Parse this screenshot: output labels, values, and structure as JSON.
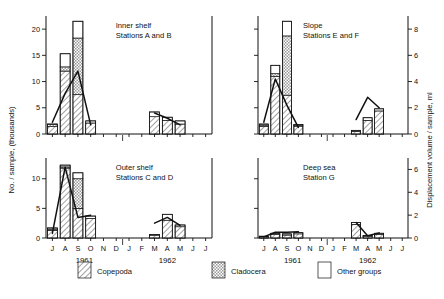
{
  "figure": {
    "left_axis_title": "No. / sample, (thousands)",
    "right_axis_title": "Displacement volume / sample, ml",
    "year_labels": [
      "1961",
      "1962"
    ],
    "months_1961": [
      "J",
      "A",
      "S",
      "O",
      "N",
      "D"
    ],
    "months_1962": [
      "J",
      "F",
      "M",
      "A",
      "M",
      "J",
      "J"
    ]
  },
  "legend": {
    "items": [
      {
        "label": "Copepoda",
        "pattern": "diagonal-hatch"
      },
      {
        "label": "Cladocera",
        "pattern": "stipple"
      },
      {
        "label": "Other groups",
        "pattern": "blank"
      }
    ]
  },
  "chart_data": {
    "type": "bar",
    "title": "",
    "xlabel": "",
    "ylabel": "No. / sample, (thousands)",
    "y2label": "Displacement volume / sample, ml",
    "grid": false,
    "legend_position": "bottom",
    "categories": [
      "J-1961",
      "A-1961",
      "S-1961",
      "O-1961",
      "N-1961",
      "D-1961",
      "J-1962",
      "F-1962",
      "M-1962",
      "A-1962",
      "M-1962b",
      "J-1962",
      "J-1962b"
    ],
    "panels": [
      {
        "name": "inner-shelf",
        "title_line1": "Inner shelf",
        "title_line2": "Stations A and B",
        "ylim": [
          0,
          22.5
        ],
        "yticks": [
          0,
          5,
          10,
          15,
          20
        ],
        "ytick_labels": [
          "0",
          "5",
          "10",
          "15",
          "20"
        ],
        "y2lim": [
          0,
          9
        ],
        "series": [
          {
            "name": "Copepoda",
            "values": [
              1.4,
              12.0,
              7.5,
              2.1,
              0,
              0,
              0,
              0,
              3.3,
              2.6,
              1.9,
              0,
              0
            ]
          },
          {
            "name": "Cladocera",
            "values": [
              0.4,
              0.8,
              10.8,
              0.0,
              0,
              0,
              0,
              0,
              0.0,
              0.0,
              0.0,
              0,
              0
            ]
          },
          {
            "name": "Other groups",
            "values": [
              0.1,
              2.5,
              3.2,
              0.4,
              0,
              0,
              0,
              0,
              0.9,
              0.6,
              0.6,
              0,
              0
            ]
          }
        ],
        "totals": [
          1.9,
          15.3,
          21.5,
          2.5,
          0,
          0,
          0,
          0,
          4.2,
          3.2,
          2.5,
          0,
          0
        ],
        "volume_line": {
          "name": "Displacement volume",
          "x": [
            "J-1961",
            "A-1961",
            "S-1961",
            "O-1961"
          ],
          "values": [
            0.9,
            3.1,
            4.8,
            0.7
          ]
        },
        "volume_line2": {
          "x": [
            "M-1962",
            "A-1962",
            "M-1962b"
          ],
          "values": [
            1.6,
            1.2,
            0.7
          ]
        }
      },
      {
        "name": "slope",
        "title_line1": "Slope",
        "title_line2": "Stations E and F",
        "ylim": [
          0,
          22.5
        ],
        "yticks": [
          0,
          5,
          10,
          15,
          20
        ],
        "ytick_labels": [
          "",
          "",
          "",
          "",
          ""
        ],
        "y2lim": [
          0,
          9
        ],
        "y2ticks": [
          0,
          2,
          4,
          6,
          8
        ],
        "y2tick_labels": [
          "0",
          "2",
          "4",
          "6",
          "8"
        ],
        "series": [
          {
            "name": "Copepoda",
            "values": [
              1.4,
              11.0,
              7.4,
              1.5,
              0,
              0,
              0,
              0,
              0.5,
              2.6,
              4.4,
              0,
              0
            ]
          },
          {
            "name": "Cladocera",
            "values": [
              0.3,
              0.5,
              11.3,
              0.1,
              0,
              0,
              0,
              0,
              0.0,
              0.0,
              0.0,
              0,
              0
            ]
          },
          {
            "name": "Other groups",
            "values": [
              0.2,
              1.6,
              2.8,
              0.2,
              0,
              0,
              0,
              0,
              0.2,
              0.5,
              0.4,
              0,
              0
            ]
          }
        ],
        "totals": [
          1.9,
          13.1,
          21.5,
          1.8,
          0,
          0,
          0,
          0,
          0.7,
          3.1,
          4.8,
          0,
          0
        ],
        "volume_line": {
          "x": [
            "J-1961",
            "A-1961",
            "S-1961",
            "O-1961"
          ],
          "values": [
            0.9,
            4.2,
            2.2,
            0.5
          ]
        },
        "volume_line2": {
          "x": [
            "M-1962",
            "A-1962",
            "M-1962b"
          ],
          "values": [
            1.1,
            2.8,
            2.0
          ]
        }
      },
      {
        "name": "outer-shelf",
        "title_line1": "Outer shelf",
        "title_line2": "Stations C and D",
        "ylim": [
          0,
          13.5
        ],
        "yticks": [
          0,
          5,
          10
        ],
        "ytick_labels": [
          "0",
          "5",
          "10"
        ],
        "y2lim": [
          0,
          7
        ],
        "series": [
          {
            "name": "Copepoda",
            "values": [
              1.3,
              11.8,
              5.0,
              3.3,
              0,
              0,
              0,
              0,
              0.4,
              3.0,
              1.9,
              0,
              0
            ]
          },
          {
            "name": "Cladocera",
            "values": [
              0.2,
              0.2,
              5.0,
              0.0,
              0,
              0,
              0,
              0,
              0.0,
              0.0,
              0.0,
              0,
              0
            ]
          },
          {
            "name": "Other groups",
            "values": [
              0.2,
              0.3,
              1.0,
              0.4,
              0,
              0,
              0,
              0,
              0.2,
              1.0,
              0.3,
              0,
              0
            ]
          }
        ],
        "totals": [
          1.7,
          12.3,
          11.0,
          3.7,
          0,
          0,
          0,
          0,
          0.6,
          4.0,
          2.2,
          0,
          0
        ],
        "volume_line": {
          "x": [
            "J-1961",
            "A-1961",
            "S-1961",
            "O-1961"
          ],
          "values": [
            0.4,
            6.2,
            1.8,
            2.0
          ]
        },
        "volume_line2": {
          "x": [
            "M-1962",
            "A-1962",
            "M-1962b"
          ],
          "values": [
            1.3,
            1.8,
            1.1
          ]
        }
      },
      {
        "name": "deep-sea",
        "title_line1": "Deep sea",
        "title_line2": "Station G",
        "ylim": [
          0,
          13.5
        ],
        "yticks": [
          0,
          5,
          10
        ],
        "ytick_labels": [
          "",
          "",
          ""
        ],
        "y2lim": [
          0,
          7
        ],
        "y2ticks": [
          0,
          2,
          4,
          6
        ],
        "y2tick_labels": [
          "0",
          "2",
          "4",
          "6"
        ],
        "series": [
          {
            "name": "Copepoda",
            "values": [
              0.2,
              0.6,
              0.5,
              0.7,
              0,
              0,
              0,
              0,
              2.3,
              0.3,
              0.6,
              0,
              0
            ]
          },
          {
            "name": "Cladocera",
            "values": [
              0.0,
              0.0,
              0.0,
              0.0,
              0,
              0,
              0,
              0,
              0.0,
              0.0,
              0.0,
              0,
              0
            ]
          },
          {
            "name": "Other groups",
            "values": [
              0.1,
              0.2,
              0.2,
              0.2,
              0,
              0,
              0,
              0,
              0.3,
              0.1,
              0.2,
              0,
              0
            ]
          }
        ],
        "totals": [
          0.3,
          0.8,
          0.7,
          0.9,
          0,
          0,
          0,
          0,
          2.6,
          0.4,
          0.8,
          0,
          0
        ],
        "volume_line": {
          "x": [
            "J-1961",
            "A-1961",
            "S-1961",
            "O-1961"
          ],
          "values": [
            0.1,
            0.5,
            0.5,
            0.55
          ]
        },
        "volume_line2": {
          "x": [
            "M-1962",
            "A-1962",
            "M-1962b"
          ],
          "values": [
            1.35,
            0.2,
            0.45
          ]
        }
      }
    ]
  }
}
